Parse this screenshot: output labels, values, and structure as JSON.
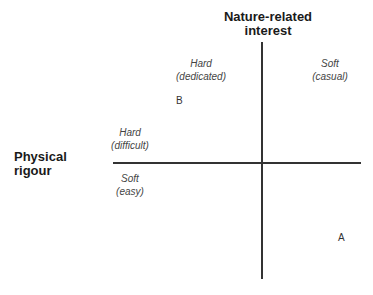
{
  "axes": {
    "vertical_title_line1": "Nature-related",
    "vertical_title_line2": "interest",
    "horizontal_title_line1": "Physical",
    "horizontal_title_line2": "rigour"
  },
  "quadrant_labels": {
    "hard_dedicated": {
      "line1": "Hard",
      "line2": "(dedicated)"
    },
    "soft_casual": {
      "line1": "Soft",
      "line2": "(casual)"
    },
    "hard_difficult": {
      "line1": "Hard",
      "line2": "(difficult)"
    },
    "soft_easy": {
      "line1": "Soft",
      "line2": "(easy)"
    }
  },
  "points": {
    "a": "A",
    "b": "B"
  },
  "colors": {
    "axis_line": "#333333",
    "label_text": "#444444"
  }
}
